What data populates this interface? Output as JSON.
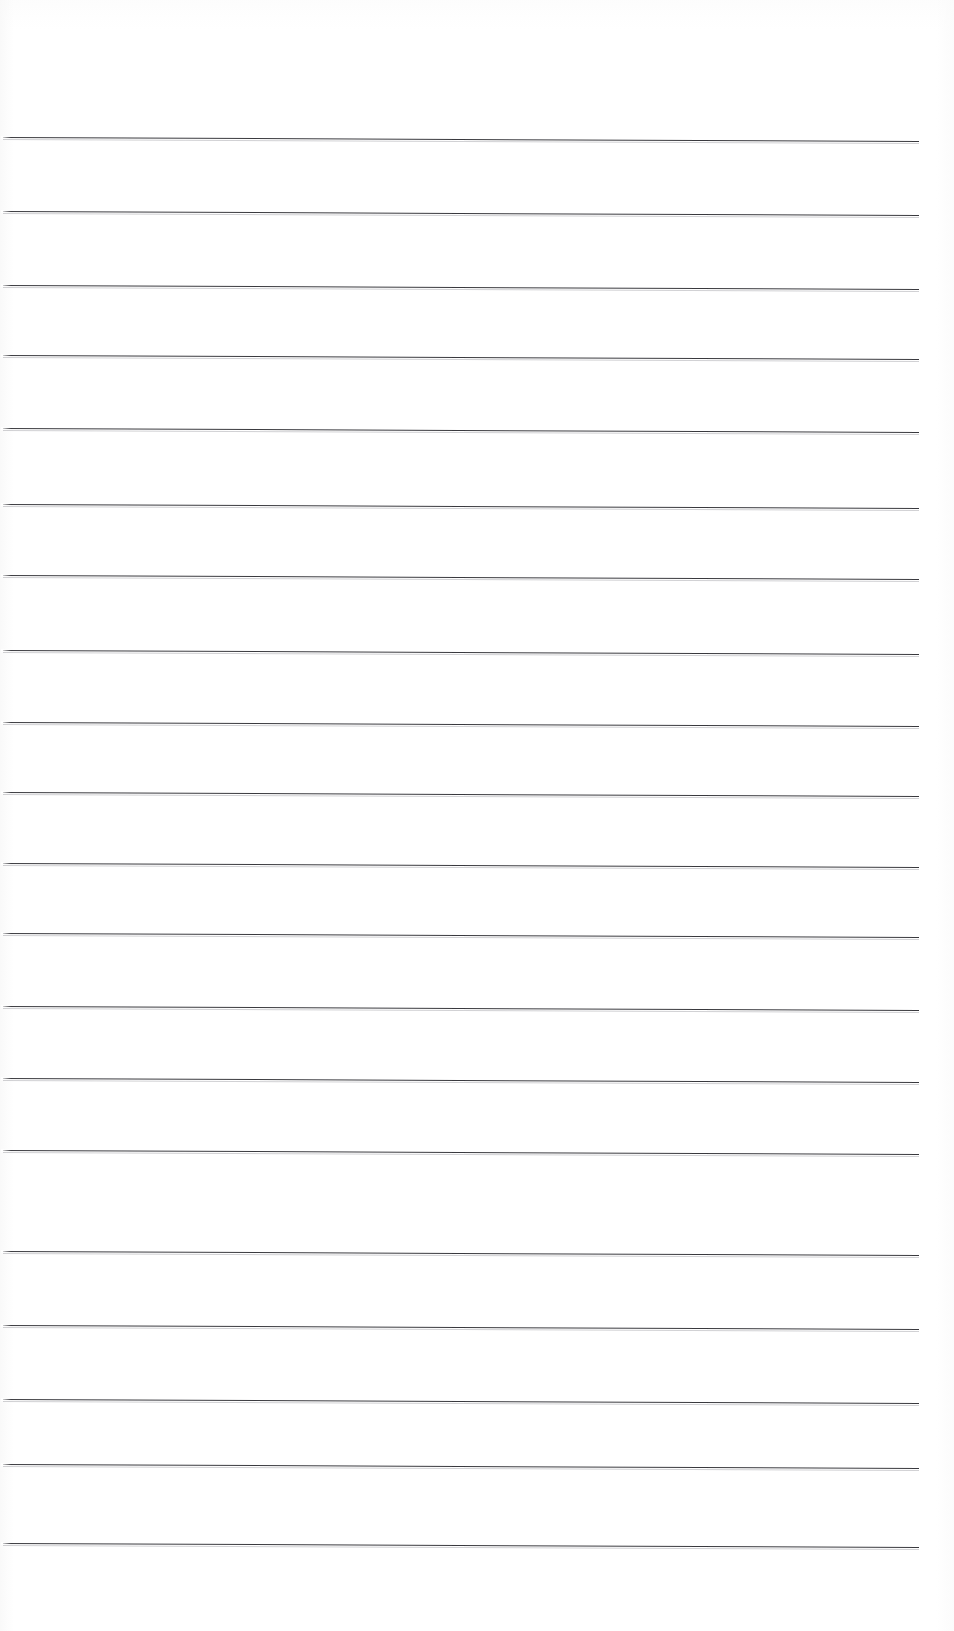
{
  "document": {
    "type": "scanned-lined-paper",
    "title": "Blank Ruled Notebook Page",
    "page_width": 954,
    "page_height": 1631,
    "background_color": "#ffffff",
    "content_text": "",
    "has_text": false,
    "has_header": false,
    "has_footer": false,
    "has_page_number": false,
    "has_margin_rule": false
  },
  "ruling": {
    "line_color": "#2b2b30",
    "line_thickness_px": 1.6,
    "line_count": 20,
    "line_left_x": 3,
    "line_right_x": 919,
    "line_length_px": 916,
    "first_line_y": 137,
    "line_pitch_px": 70.2,
    "slant_deg": 0.25,
    "top_margin_px": 137,
    "bottom_margin_px": 88,
    "left_margin_px": 3,
    "right_margin_px": 35,
    "lines": [
      {
        "index": 1,
        "y": 137,
        "x_start": 3,
        "x_end": 919
      },
      {
        "index": 2,
        "y": 211,
        "x_start": 3,
        "x_end": 919
      },
      {
        "index": 3,
        "y": 285,
        "x_start": 3,
        "x_end": 919
      },
      {
        "index": 4,
        "y": 355,
        "x_start": 3,
        "x_end": 919
      },
      {
        "index": 5,
        "y": 428,
        "x_start": 3,
        "x_end": 919
      },
      {
        "index": 6,
        "y": 504,
        "x_start": 3,
        "x_end": 919
      },
      {
        "index": 7,
        "y": 575,
        "x_start": 3,
        "x_end": 919
      },
      {
        "index": 8,
        "y": 650,
        "x_start": 3,
        "x_end": 919
      },
      {
        "index": 9,
        "y": 722,
        "x_start": 3,
        "x_end": 919
      },
      {
        "index": 10,
        "y": 792,
        "x_start": 3,
        "x_end": 919
      },
      {
        "index": 11,
        "y": 863,
        "x_start": 3,
        "x_end": 919
      },
      {
        "index": 12,
        "y": 933,
        "x_start": 3,
        "x_end": 919
      },
      {
        "index": 13,
        "y": 1006,
        "x_start": 3,
        "x_end": 919
      },
      {
        "index": 14,
        "y": 1078,
        "x_start": 3,
        "x_end": 919
      },
      {
        "index": 15,
        "y": 1150,
        "x_start": 3,
        "x_end": 919
      },
      {
        "index": 16,
        "y": 1251,
        "x_start": 3,
        "x_end": 919
      },
      {
        "index": 17,
        "y": 1325,
        "x_start": 3,
        "x_end": 919
      },
      {
        "index": 18,
        "y": 1399,
        "x_start": 3,
        "x_end": 919
      },
      {
        "index": 19,
        "y": 1464,
        "x_start": 3,
        "x_end": 919
      },
      {
        "index": 20,
        "y": 1543,
        "x_start": 3,
        "x_end": 919
      }
    ]
  }
}
